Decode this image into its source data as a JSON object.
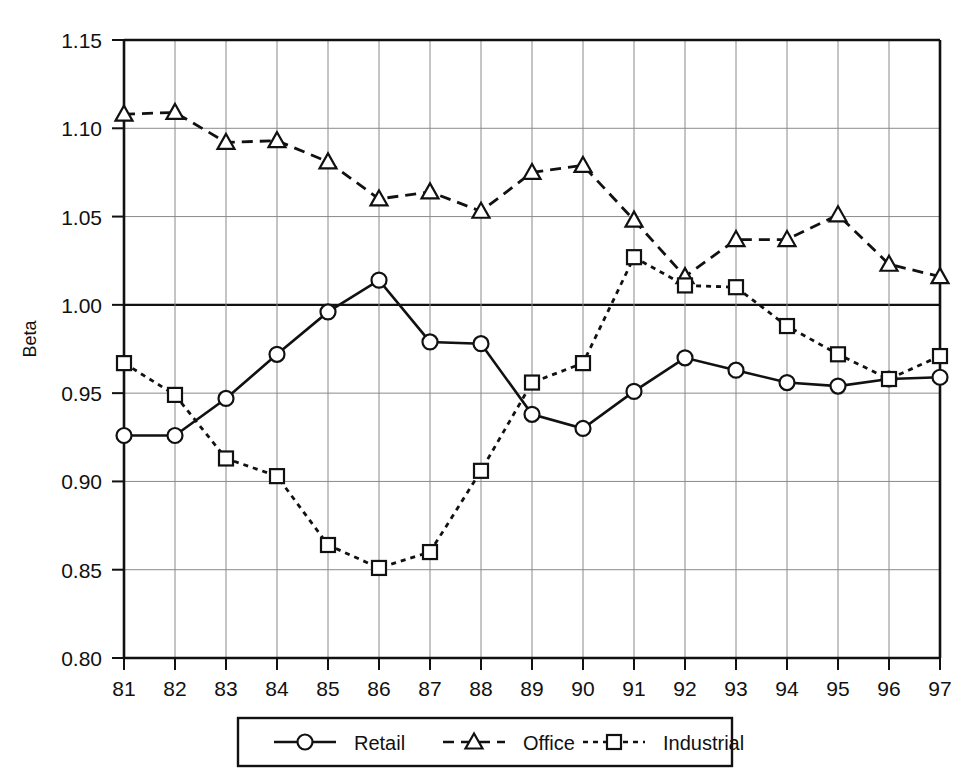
{
  "chart_data": {
    "type": "line",
    "title": "",
    "xlabel": "",
    "ylabel": "Beta",
    "x": [
      "81",
      "82",
      "83",
      "84",
      "85",
      "86",
      "87",
      "88",
      "89",
      "90",
      "91",
      "92",
      "93",
      "94",
      "95",
      "96",
      "97"
    ],
    "categories": [
      "81",
      "82",
      "83",
      "84",
      "85",
      "86",
      "87",
      "88",
      "89",
      "90",
      "91",
      "92",
      "93",
      "94",
      "95",
      "96",
      "97"
    ],
    "ylim": [
      0.8,
      1.15
    ],
    "ytick_labels": [
      "0.80",
      "0.85",
      "0.90",
      "0.95",
      "1.00",
      "1.05",
      "1.10",
      "1.15"
    ],
    "ytick_values": [
      0.8,
      0.85,
      0.9,
      0.95,
      1.0,
      1.05,
      1.1,
      1.15
    ],
    "grid": true,
    "legend_position": "bottom",
    "emphasis_line": 1.0,
    "series": [
      {
        "name": "Retail",
        "marker": "circle",
        "line_style": "solid",
        "color": "#111111",
        "values": [
          0.926,
          0.926,
          0.947,
          0.972,
          0.996,
          1.014,
          0.979,
          0.978,
          0.938,
          0.93,
          0.951,
          0.97,
          0.963,
          0.956,
          0.954,
          0.958,
          0.959
        ]
      },
      {
        "name": "Office",
        "marker": "triangle",
        "line_style": "dashed",
        "color": "#111111",
        "values": [
          1.108,
          1.109,
          1.092,
          1.093,
          1.081,
          1.06,
          1.064,
          1.053,
          1.075,
          1.079,
          1.048,
          1.016,
          1.037,
          1.037,
          1.051,
          1.023,
          1.016
        ]
      },
      {
        "name": "Industrial",
        "marker": "square",
        "line_style": "dotted",
        "color": "#111111",
        "values": [
          0.967,
          0.949,
          0.913,
          0.903,
          0.864,
          0.851,
          0.86,
          0.906,
          0.956,
          0.967,
          1.027,
          1.011,
          1.01,
          0.988,
          0.972,
          0.958,
          0.971
        ]
      }
    ]
  },
  "legend": {
    "items": [
      {
        "label": "Retail"
      },
      {
        "label": "Office"
      },
      {
        "label": "Industrial"
      }
    ]
  },
  "axes": {
    "y_title": "Beta"
  }
}
